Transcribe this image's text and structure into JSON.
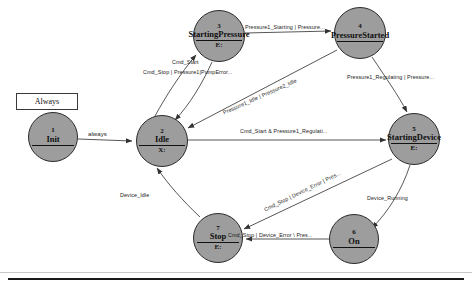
{
  "diagram": {
    "type": "state-chart",
    "always_box": {
      "label": "Always"
    },
    "states": [
      {
        "id": "1",
        "number": "1",
        "name": "Init",
        "variable": "",
        "cx": 53,
        "cy": 137,
        "r": 25
      },
      {
        "id": "2",
        "number": "2",
        "name": "Idle",
        "variable": "X:",
        "cx": 162,
        "cy": 141,
        "r": 26
      },
      {
        "id": "3",
        "number": "3",
        "name": "StartingPressure",
        "variable": "E:",
        "cx": 219,
        "cy": 36,
        "r": 26
      },
      {
        "id": "4",
        "number": "4",
        "name": "PressureStarted",
        "variable": "",
        "cx": 360,
        "cy": 33,
        "r": 26
      },
      {
        "id": "5",
        "number": "5",
        "name": "StartingDevice",
        "variable": "E:",
        "cx": 414,
        "cy": 139,
        "r": 26
      },
      {
        "id": "6",
        "number": "6",
        "name": "On",
        "variable": "",
        "cx": 354,
        "cy": 239,
        "r": 25
      },
      {
        "id": "7",
        "number": "7",
        "name": "Stop",
        "variable": "E:",
        "cx": 218,
        "cy": 238,
        "r": 25
      }
    ],
    "transitions": [
      {
        "id": "t1",
        "from": "1",
        "to": "2",
        "label": "always",
        "lx": 88,
        "ly": 134,
        "rot": 0
      },
      {
        "id": "t2",
        "from": "2",
        "to": "3",
        "label": "Cmd_Start",
        "lx": 172,
        "ly": 62,
        "rot": 0
      },
      {
        "id": "t3",
        "from": "3",
        "to": "2",
        "label": "Cmd_Stop | Pressure1|PumpError...",
        "lx": 146,
        "ly": 71,
        "rot": 0
      },
      {
        "id": "t4",
        "from": "3",
        "to": "4",
        "label": "Pressure1_Starting | Pressure...",
        "lx": 246,
        "ly": 27,
        "rot": 0
      },
      {
        "id": "t5",
        "from": "4",
        "to": "2",
        "label": "Pressure1_Idle | Pressure2_Idle",
        "lx": 219,
        "ly": 108,
        "rot": -23
      },
      {
        "id": "t6",
        "from": "4",
        "to": "5",
        "label": "Pressure1_Regulating | Pressure...",
        "lx": 348,
        "ly": 76,
        "rot": 0
      },
      {
        "id": "t7",
        "from": "2",
        "to": "5",
        "label": "Cmd_Start & Pressure1_Regulati...",
        "lx": 240,
        "ly": 130,
        "rot": 0
      },
      {
        "id": "t8",
        "from": "5",
        "to": "6",
        "label": "Device_Running",
        "lx": 370,
        "ly": 197,
        "rot": 0
      },
      {
        "id": "t9",
        "from": "5",
        "to": "7",
        "label": "Cmd_Stop | Device_Error | Pres...",
        "lx": 262,
        "ly": 208,
        "rot": -26
      },
      {
        "id": "t10",
        "from": "6",
        "to": "7",
        "label": "Cmd_Stop | Device_Error \\ Pres...",
        "lx": 229,
        "ly": 233,
        "rot": 0
      },
      {
        "id": "t11",
        "from": "7",
        "to": "2",
        "label": "Device_Idle",
        "lx": 122,
        "ly": 193,
        "rot": 0
      }
    ]
  }
}
